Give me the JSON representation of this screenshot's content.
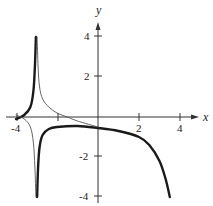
{
  "chart_data": {
    "type": "line",
    "title": "",
    "xlabel": "x",
    "ylabel": "y",
    "xlim": [
      -4.3,
      4.6
    ],
    "ylim": [
      -4.3,
      4.6
    ],
    "grid": false,
    "x_ticks": [
      -4,
      -2,
      2,
      4
    ],
    "y_ticks": [
      4,
      2,
      -2,
      -4
    ],
    "x_tick_labels": [
      "-4",
      "-2",
      "2",
      "4"
    ],
    "y_tick_labels": [
      "4",
      "2",
      "-2",
      "-4"
    ],
    "visible_x_tick_labels": [
      "-4",
      "2",
      "4"
    ],
    "visible_y_tick_labels": [
      "4",
      "2",
      "-2",
      "-4"
    ],
    "vertical_asymptote_x": -3,
    "series": [
      {
        "name": "thick-curve",
        "style": "thick",
        "segments": [
          {
            "x": [
              -4.0,
              -3.6,
              -3.3,
              -3.15,
              -3.08,
              -3.03
            ],
            "y": [
              -0.1,
              0.1,
              0.5,
              1.3,
              2.5,
              4.0
            ]
          },
          {
            "x": [
              -2.97,
              -2.92,
              -2.85,
              -2.7,
              -2.4,
              -2.0,
              -1.0,
              0.0,
              1.0,
              2.0,
              2.5,
              3.0,
              3.3,
              3.5
            ],
            "y": [
              -4.0,
              -2.5,
              -1.5,
              -0.9,
              -0.6,
              -0.5,
              -0.45,
              -0.55,
              -0.7,
              -1.0,
              -1.4,
              -2.2,
              -3.1,
              -4.0
            ]
          }
        ]
      },
      {
        "name": "thin-curve",
        "style": "thin",
        "segments": [
          {
            "x": [
              -4.0,
              -3.6,
              -3.3,
              -3.15,
              -3.08,
              -3.03
            ],
            "y": [
              0.1,
              -0.1,
              -0.5,
              -1.3,
              -2.5,
              -4.0
            ]
          },
          {
            "x": [
              -2.97,
              -2.92,
              -2.85,
              -2.7,
              -2.4,
              -2.0,
              -1.5,
              -1.0,
              0.0
            ],
            "y": [
              4.0,
              2.5,
              1.5,
              0.9,
              0.5,
              0.2,
              0.0,
              -0.2,
              -0.5
            ]
          }
        ]
      }
    ]
  },
  "labels": {
    "x_axis": "x",
    "y_axis": "y",
    "xt_m4": "-4",
    "xt_2": "2",
    "xt_4": "4",
    "yt_4": "4",
    "yt_2": "2",
    "yt_m2": "-2",
    "yt_m4": "-4"
  }
}
